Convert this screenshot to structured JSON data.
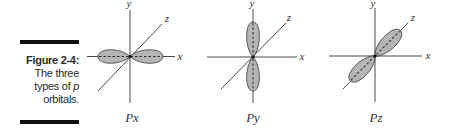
{
  "caption": {
    "figure_number": "Figure 2-4:",
    "lines": [
      "The three",
      "types of ",
      "orbitals."
    ],
    "italic_word": "p"
  },
  "colors": {
    "rule": "#111111",
    "lobe_fill": "#b5b5b5",
    "lobe_stroke": "#3a3a3a",
    "axis": "#4a4a4a",
    "text": "#2a2a2a"
  },
  "diagrams": [
    {
      "orbital": "Px",
      "axes": {
        "x": "x",
        "y": "y",
        "z": "z"
      },
      "lobe_axis": "x"
    },
    {
      "orbital": "Py",
      "axes": {
        "x": "x",
        "y": "y",
        "z": "z"
      },
      "lobe_axis": "y"
    },
    {
      "orbital": "Pz",
      "axes": {
        "x": "x",
        "y": "y",
        "z": "z"
      },
      "lobe_axis": "z"
    }
  ]
}
